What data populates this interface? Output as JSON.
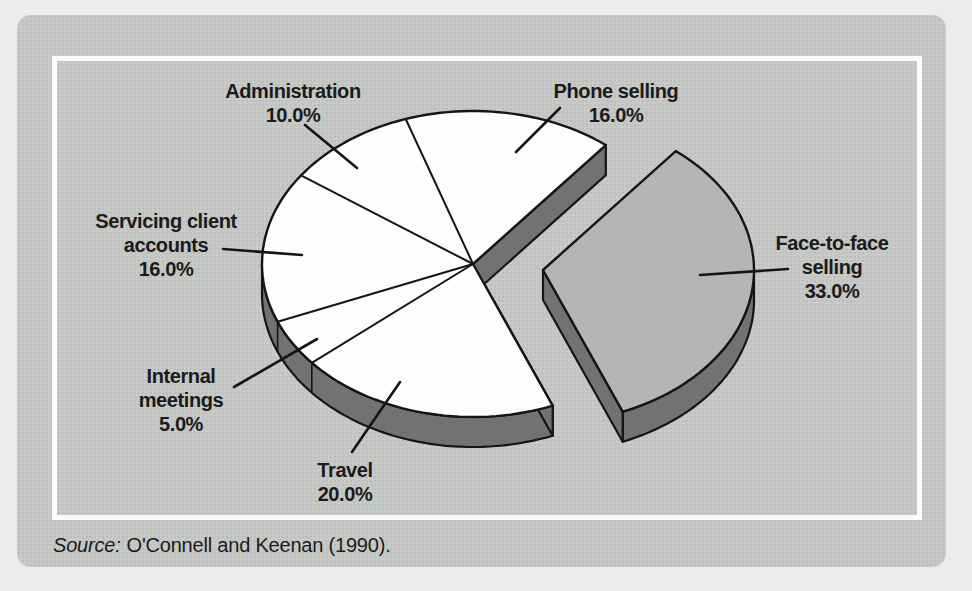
{
  "figure": {
    "source_prefix": "Source:",
    "source_text": "O'Connell and Keenan (1990)."
  },
  "chart_data": {
    "type": "pie",
    "style": "3d-exploded-pie",
    "title": "",
    "direction": "clockwise",
    "start_angle_deg": 108.6,
    "depth_px": 30,
    "legend": "none",
    "slices": [
      {
        "label": "Phone selling",
        "label_lines": [
          "Phone selling"
        ],
        "value_pct": 16.0,
        "pct_label": "16.0%",
        "exploded": false,
        "fill": "#fdfdfd"
      },
      {
        "label": "Face-to-face selling",
        "label_lines": [
          "Face-to-face",
          "selling"
        ],
        "value_pct": 33.0,
        "pct_label": "33.0%",
        "exploded": true,
        "fill": "#b4b6b4"
      },
      {
        "label": "Travel",
        "label_lines": [
          "Travel"
        ],
        "value_pct": 20.0,
        "pct_label": "20.0%",
        "exploded": false,
        "fill": "#fdfdfd"
      },
      {
        "label": "Internal meetings",
        "label_lines": [
          "Internal",
          "meetings"
        ],
        "value_pct": 5.0,
        "pct_label": "5.0%",
        "exploded": false,
        "fill": "#fdfdfd"
      },
      {
        "label": "Servicing client accounts",
        "label_lines": [
          "Servicing client",
          "accounts"
        ],
        "value_pct": 16.0,
        "pct_label": "16.0%",
        "exploded": false,
        "fill": "#fdfdfd"
      },
      {
        "label": "Administration",
        "label_lines": [
          "Administration"
        ],
        "value_pct": 10.0,
        "pct_label": "10.0%",
        "exploded": false,
        "fill": "#fdfdfd"
      }
    ],
    "colors": {
      "slice_fill": "#fdfdfd",
      "exploded_fill": "#b4b6b4",
      "side": "#717371",
      "outline": "#151515",
      "card_bg": "#c7c9c7",
      "page_bg": "#ecedeb",
      "frame": "#fbfbf9",
      "text": "#1b1b1b"
    }
  }
}
